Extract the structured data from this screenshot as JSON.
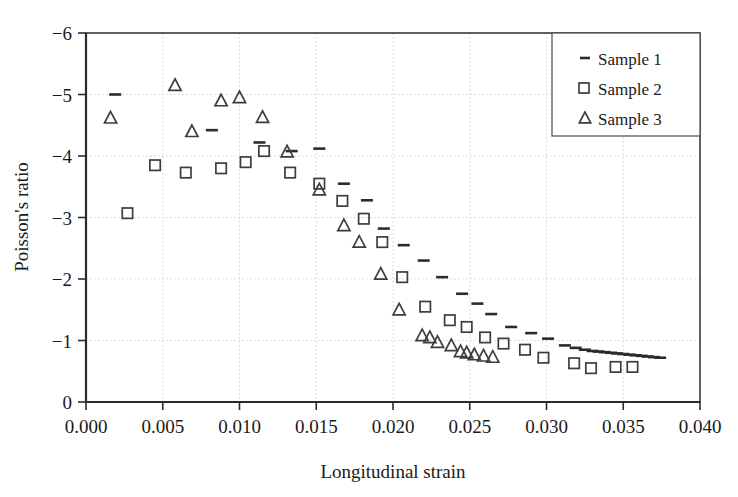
{
  "chart_data": {
    "type": "scatter",
    "title": "",
    "xlabel": "Longitudinal strain",
    "ylabel": "Poisson's ratio",
    "xlim": [
      0.0,
      0.04
    ],
    "ylim": [
      0,
      -6
    ],
    "y_inverted": true,
    "xticks": [
      0.0,
      0.005,
      0.01,
      0.015,
      0.02,
      0.025,
      0.03,
      0.035,
      0.04
    ],
    "xtick_labels": [
      "0.000",
      "0.005",
      "0.010",
      "0.015",
      "0.020",
      "0.025",
      "0.030",
      "0.035",
      "0.040"
    ],
    "yticks": [
      0,
      -1,
      -2,
      -3,
      -4,
      -5,
      -6
    ],
    "ytick_labels": [
      "0",
      "−1",
      "−2",
      "−3",
      "−4",
      "−5",
      "−6"
    ],
    "grid": true,
    "legend_position": "top-right",
    "series": [
      {
        "name": "Sample 1",
        "marker": "dash",
        "color": "#2b2b2b",
        "points": [
          [
            0.0019,
            -5.0
          ],
          [
            0.0082,
            -4.42
          ],
          [
            0.0113,
            -4.22
          ],
          [
            0.0134,
            -4.08
          ],
          [
            0.0152,
            -4.12
          ],
          [
            0.0168,
            -3.55
          ],
          [
            0.0183,
            -3.28
          ],
          [
            0.0194,
            -2.82
          ],
          [
            0.0207,
            -2.55
          ],
          [
            0.022,
            -2.3
          ],
          [
            0.0232,
            -2.03
          ],
          [
            0.0245,
            -1.76
          ],
          [
            0.0255,
            -1.6
          ],
          [
            0.0264,
            -1.43
          ],
          [
            0.0277,
            -1.22
          ],
          [
            0.029,
            -1.12
          ],
          [
            0.0301,
            -1.03
          ],
          [
            0.0312,
            -0.92
          ],
          [
            0.0319,
            -0.88
          ],
          [
            0.0325,
            -0.85
          ],
          [
            0.033,
            -0.83
          ],
          [
            0.0334,
            -0.82
          ],
          [
            0.0338,
            -0.81
          ],
          [
            0.0342,
            -0.8
          ],
          [
            0.0346,
            -0.79
          ],
          [
            0.035,
            -0.78
          ],
          [
            0.0354,
            -0.77
          ],
          [
            0.0358,
            -0.76
          ],
          [
            0.0362,
            -0.75
          ],
          [
            0.0366,
            -0.74
          ],
          [
            0.037,
            -0.73
          ],
          [
            0.0374,
            -0.72
          ]
        ]
      },
      {
        "name": "Sample 2",
        "marker": "square",
        "color": "#3d3d3d",
        "points": [
          [
            0.0027,
            -3.07
          ],
          [
            0.0045,
            -3.85
          ],
          [
            0.0065,
            -3.73
          ],
          [
            0.0088,
            -3.8
          ],
          [
            0.0104,
            -3.9
          ],
          [
            0.0116,
            -4.08
          ],
          [
            0.0133,
            -3.73
          ],
          [
            0.0152,
            -3.55
          ],
          [
            0.0167,
            -3.27
          ],
          [
            0.0181,
            -2.98
          ],
          [
            0.0193,
            -2.6
          ],
          [
            0.0206,
            -2.03
          ],
          [
            0.0221,
            -1.55
          ],
          [
            0.0237,
            -1.33
          ],
          [
            0.0248,
            -1.22
          ],
          [
            0.026,
            -1.05
          ],
          [
            0.0272,
            -0.95
          ],
          [
            0.0286,
            -0.85
          ],
          [
            0.0298,
            -0.72
          ],
          [
            0.0318,
            -0.63
          ],
          [
            0.0329,
            -0.55
          ],
          [
            0.0345,
            -0.57
          ],
          [
            0.0356,
            -0.57
          ]
        ]
      },
      {
        "name": "Sample 3",
        "marker": "triangle",
        "color": "#3d3d3d",
        "points": [
          [
            0.0016,
            -4.62
          ],
          [
            0.0058,
            -5.15
          ],
          [
            0.0069,
            -4.4
          ],
          [
            0.0088,
            -4.9
          ],
          [
            0.01,
            -4.95
          ],
          [
            0.0115,
            -4.63
          ],
          [
            0.0131,
            -4.07
          ],
          [
            0.0152,
            -3.45
          ],
          [
            0.0168,
            -2.87
          ],
          [
            0.0178,
            -2.6
          ],
          [
            0.0192,
            -2.08
          ],
          [
            0.0204,
            -1.5
          ],
          [
            0.0219,
            -1.08
          ],
          [
            0.0224,
            -1.05
          ],
          [
            0.0229,
            -0.97
          ],
          [
            0.0238,
            -0.92
          ],
          [
            0.0244,
            -0.82
          ],
          [
            0.0248,
            -0.8
          ],
          [
            0.0253,
            -0.77
          ],
          [
            0.0259,
            -0.75
          ],
          [
            0.0265,
            -0.73
          ]
        ]
      }
    ]
  },
  "legend": {
    "entries": [
      {
        "label": "Sample 1",
        "marker": "dash"
      },
      {
        "label": "Sample 2",
        "marker": "square"
      },
      {
        "label": "Sample 3",
        "marker": "triangle"
      }
    ]
  }
}
